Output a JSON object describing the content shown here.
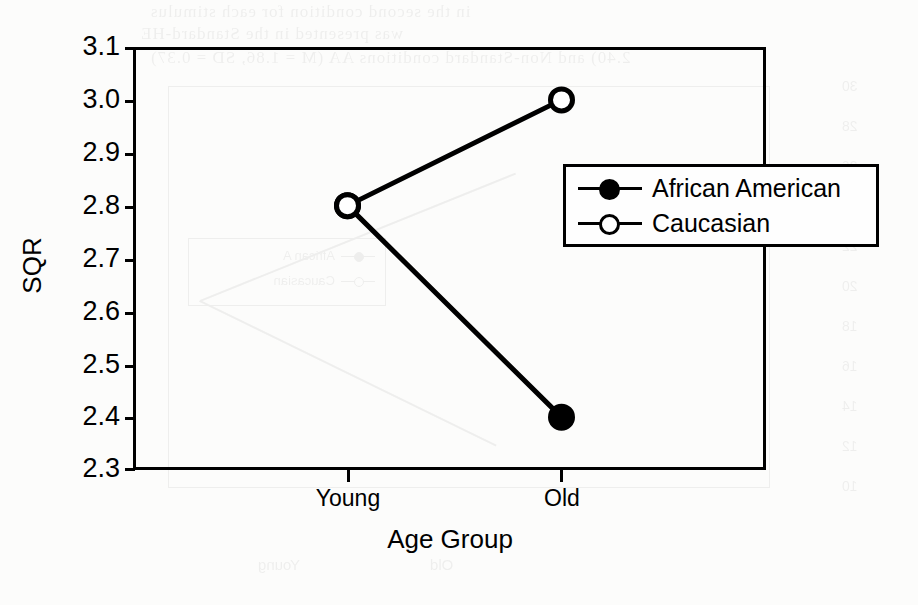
{
  "chart_data": {
    "type": "line",
    "title": "",
    "xlabel": "Age Group",
    "ylabel": "SQR",
    "categories": [
      "Young",
      "Old"
    ],
    "series": [
      {
        "name": "African American",
        "values": [
          2.8,
          2.4
        ],
        "marker": "filled-circle",
        "color": "#000000"
      },
      {
        "name": "Caucasian",
        "values": [
          2.8,
          3.0
        ],
        "marker": "open-circle",
        "color": "#000000"
      }
    ],
    "ylim": [
      2.3,
      3.1
    ],
    "y_ticks": [
      "3.1",
      "3.0",
      "2.9",
      "2.8",
      "2.7",
      "2.6",
      "2.5",
      "2.4",
      "2.3"
    ],
    "y_tick_values": [
      3.1,
      3.0,
      2.9,
      2.8,
      2.7,
      2.6,
      2.5,
      2.4,
      2.3
    ],
    "x_ticks": [
      "Young",
      "Old"
    ],
    "grid": false,
    "legend_position": "upper-right-inside",
    "line_color": "#000000",
    "frame_color": "#000000",
    "background": "#ffffff"
  },
  "legend": {
    "entries": [
      {
        "label": "African American",
        "marker": "filled-circle"
      },
      {
        "label": "Caucasian",
        "marker": "open-circle"
      }
    ]
  },
  "axes": {
    "y_title": "SQR",
    "x_title": "Age Group"
  },
  "bleed_through": {
    "line1": "in the second condition for each stimulus",
    "line2": "was presented in the Standard-HE",
    "line3": "2.40) and Non-Standard conditions AA (M = 1.86, SD = 0.37)",
    "legend_entry_1": "African A",
    "legend_entry_2": "Caucasian",
    "axis_numbers": [
      "30",
      "28",
      "26",
      "24",
      "22",
      "20",
      "18",
      "16",
      "14",
      "12",
      "10"
    ],
    "x_tick_1": "Young",
    "x_tick_2": "Old"
  }
}
